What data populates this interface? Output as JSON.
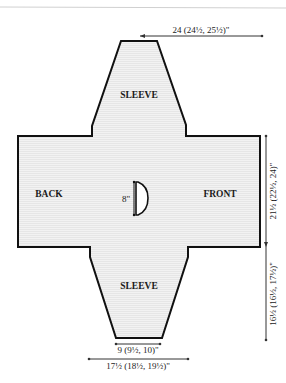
{
  "diagram": {
    "type": "sweater-schematic",
    "colors": {
      "outline": "#111111",
      "fill": "#e9e9e9",
      "stripe": "#f4f4f4",
      "dimension_line": "#333333",
      "top_rule": "#cfcfcf"
    },
    "pieces": {
      "sleeve_top": "SLEEVE",
      "back": "BACK",
      "front": "FRONT",
      "sleeve_bottom": "SLEEVE"
    },
    "dimensions": {
      "top_width": "24 (24½, 25½)\"",
      "body_length": "21½ (22½, 24)\"",
      "sleeve_length": "16½ (16½, 17½)\"",
      "cuff_width": "9 (9½, 10)\"",
      "upper_arm_width": "17½ (18½, 19½)\"",
      "neck_depth": "8\""
    }
  }
}
